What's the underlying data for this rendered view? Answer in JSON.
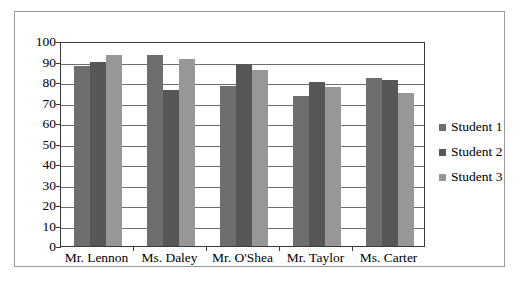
{
  "chart_data": {
    "type": "bar",
    "title": "",
    "subtitle": "",
    "xlabel": "",
    "ylabel": "",
    "categories": [
      "Mr. Lennon",
      "Ms. Daley",
      "Mr. O'Shea",
      "Mr. Taylor",
      "Ms. Carter"
    ],
    "series": [
      {
        "name": "Student 1",
        "color": "#6e6e6e",
        "values": [
          88,
          93,
          78,
          73,
          82
        ]
      },
      {
        "name": "Student 2",
        "color": "#575757",
        "values": [
          90,
          76,
          89,
          80,
          81
        ]
      },
      {
        "name": "Student 3",
        "color": "#979797",
        "values": [
          93,
          91,
          86,
          77.5,
          74.5
        ]
      }
    ],
    "ylim": [
      0,
      100
    ],
    "ytick_labels": [
      "100",
      "90",
      "80",
      "70",
      "60",
      "50",
      "40",
      "30",
      "20",
      "10",
      "0"
    ],
    "ytick_values": [
      100,
      90,
      80,
      70,
      60,
      50,
      40,
      30,
      20,
      10,
      0
    ],
    "grid": true,
    "grid_axis": "y",
    "legend_position": "right",
    "legend_entries": [
      "Student 1",
      "Student 2",
      "Student 3"
    ],
    "bar_mode": "grouped",
    "plot_border": true,
    "frame_border": true
  }
}
